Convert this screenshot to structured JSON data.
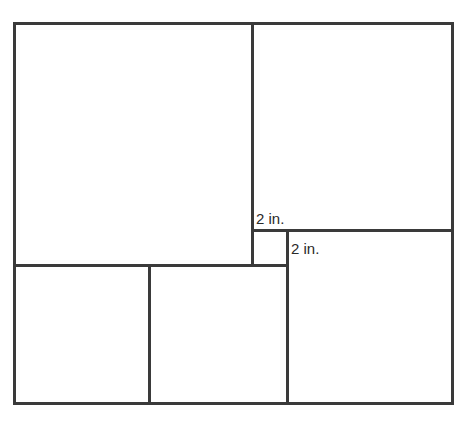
{
  "diagram": {
    "stroke_color": "#3a3a3a",
    "labels": {
      "small_square_width": "2 in.",
      "small_square_height": "2 in."
    }
  }
}
